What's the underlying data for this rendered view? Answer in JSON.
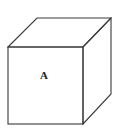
{
  "diagram": {
    "type": "cube",
    "front_face_label": "A",
    "vertices": {
      "front_top_left": [
        8,
        47
      ],
      "front_top_right": [
        83,
        47
      ],
      "front_bottom_left": [
        8,
        124
      ],
      "front_bottom_right": [
        83,
        124
      ],
      "back_top_left": [
        37,
        18
      ],
      "back_top_right": [
        111,
        18
      ],
      "back_bottom_right": [
        111,
        94
      ]
    },
    "colors": {
      "stroke": "#3a3a3a",
      "background": "#ffffff"
    }
  }
}
